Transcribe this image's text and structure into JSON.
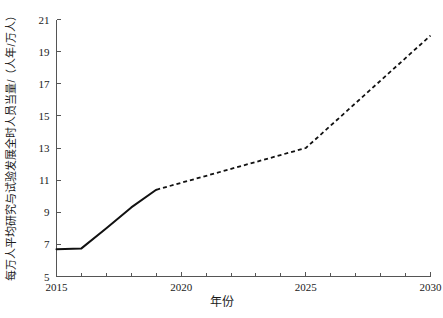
{
  "chart_data": {
    "type": "line",
    "title": "",
    "xlabel": "年份",
    "ylabel": "每万人平均研究与试验发展全时人员当量/（人年/万人）",
    "xlim": [
      2015,
      2030
    ],
    "ylim": [
      5,
      21
    ],
    "grid": false,
    "legend": "none",
    "x_ticks": [
      "2015",
      "2020",
      "2025",
      "2030"
    ],
    "x_tick_values": [
      2015,
      2020,
      2025,
      2030
    ],
    "x_minor_tick_values": [
      2015,
      2016,
      2017,
      2018,
      2019,
      2020,
      2021,
      2022,
      2023,
      2024,
      2025,
      2026,
      2027,
      2028,
      2029,
      2030
    ],
    "y_ticks": [
      "5",
      "7",
      "9",
      "11",
      "13",
      "15",
      "17",
      "19",
      "21"
    ],
    "y_tick_values": [
      5,
      7,
      9,
      11,
      13,
      15,
      17,
      19,
      21
    ],
    "series": [
      {
        "name": "historical",
        "style": "solid",
        "x": [
          2015,
          2016,
          2017,
          2018,
          2019
        ],
        "values": [
          6.7,
          6.75,
          8.0,
          9.3,
          10.4
        ]
      },
      {
        "name": "projected",
        "style": "dashed",
        "x": [
          2019,
          2025,
          2030
        ],
        "values": [
          10.4,
          13.0,
          20.0
        ]
      }
    ]
  }
}
